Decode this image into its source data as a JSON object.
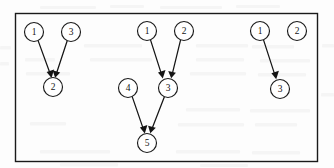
{
  "figure": {
    "background_color": "#fdfdfd",
    "border_color": "#1a1a1a",
    "node_fill": "#ffffff",
    "edge_color": "#141414",
    "panel": {
      "x": 15,
      "y": 13,
      "width": 303,
      "height": 149
    },
    "node_radius": 9.5
  },
  "graph": {
    "clusters": [
      {
        "name": "left-cluster",
        "nodes": [
          {
            "id": "l1",
            "label": "1",
            "cx": 34,
            "cy": 32
          },
          {
            "id": "l3",
            "label": "3",
            "cx": 71,
            "cy": 32
          },
          {
            "id": "l2",
            "label": "2",
            "cx": 53,
            "cy": 87
          }
        ],
        "edges": [
          {
            "from": "l1",
            "to": "l2",
            "from_label": "1",
            "to_label": "2"
          },
          {
            "from": "l3",
            "to": "l2",
            "from_label": "3",
            "to_label": "2"
          }
        ]
      },
      {
        "name": "middle-cluster",
        "nodes": [
          {
            "id": "m1",
            "label": "1",
            "cx": 147,
            "cy": 31
          },
          {
            "id": "m2",
            "label": "2",
            "cx": 184,
            "cy": 31
          },
          {
            "id": "m3",
            "label": "3",
            "cx": 168,
            "cy": 88
          },
          {
            "id": "m4",
            "label": "4",
            "cx": 128,
            "cy": 88
          },
          {
            "id": "m5",
            "label": "5",
            "cx": 147,
            "cy": 143
          }
        ],
        "edges": [
          {
            "from": "m1",
            "to": "m3",
            "from_label": "1",
            "to_label": "3"
          },
          {
            "from": "m2",
            "to": "m3",
            "from_label": "2",
            "to_label": "3"
          },
          {
            "from": "m4",
            "to": "m5",
            "from_label": "4",
            "to_label": "5"
          },
          {
            "from": "m3",
            "to": "m5",
            "from_label": "3",
            "to_label": "5"
          }
        ]
      },
      {
        "name": "right-cluster",
        "nodes": [
          {
            "id": "r1",
            "label": "1",
            "cx": 260,
            "cy": 31
          },
          {
            "id": "r2",
            "label": "2",
            "cx": 297,
            "cy": 31
          },
          {
            "id": "r3",
            "label": "3",
            "cx": 280,
            "cy": 89
          }
        ],
        "edges": [
          {
            "from": "r1",
            "to": "r3",
            "from_label": "1",
            "to_label": "3"
          }
        ]
      }
    ]
  }
}
